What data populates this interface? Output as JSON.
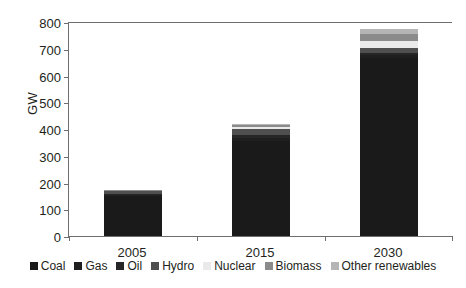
{
  "chart_data": {
    "type": "bar",
    "stacked": true,
    "title": "",
    "subtitle": "",
    "xlabel": "",
    "ylabel": "GW",
    "categories": [
      "2005",
      "2015",
      "2030"
    ],
    "ylim": [
      0,
      800
    ],
    "yticks": [
      0,
      100,
      200,
      300,
      400,
      500,
      600,
      700,
      800
    ],
    "ytick_labels": [
      "0",
      "100",
      "200",
      "300",
      "400",
      "500",
      "600",
      "700",
      "800"
    ],
    "grid": false,
    "legend_position": "bottom",
    "series": [
      {
        "name": "Coal",
        "color": "#1a1a1a",
        "values": [
          150,
          355,
          665
        ]
      },
      {
        "name": "Gas",
        "color": "#1f1f1f",
        "values": [
          4,
          12,
          12
        ]
      },
      {
        "name": "Oil",
        "color": "#262626",
        "values": [
          4,
          10,
          8
        ]
      },
      {
        "name": "Hydro",
        "color": "#4f4f4f",
        "values": [
          9,
          22,
          18
        ]
      },
      {
        "name": "Nuclear",
        "color": "#eaeaea",
        "values": [
          2,
          8,
          26
        ]
      },
      {
        "name": "Biomass",
        "color": "#8b8b8b",
        "values": [
          2,
          7,
          26
        ]
      },
      {
        "name": "Other renewables",
        "color": "#b5b5b5",
        "values": [
          1,
          6,
          20
        ]
      }
    ],
    "totals": [
      172,
      420,
      775
    ],
    "annotations": []
  },
  "axis": {
    "y_title": "GW"
  },
  "legend": {
    "items": [
      {
        "label": "Coal"
      },
      {
        "label": "Gas"
      },
      {
        "label": "Oil"
      },
      {
        "label": "Hydro"
      },
      {
        "label": "Nuclear"
      },
      {
        "label": "Biomass"
      },
      {
        "label": "Other renewables"
      }
    ]
  },
  "colors": {
    "axis": "#6d6e70",
    "text": "#231f20",
    "background": "#ffffff"
  }
}
